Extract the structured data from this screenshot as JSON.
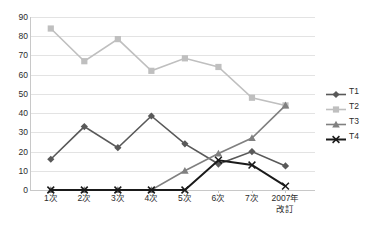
{
  "chart_data": {
    "type": "line",
    "title": "",
    "xlabel": "",
    "ylabel": "",
    "ylim": [
      0,
      90
    ],
    "ytick_step": 10,
    "grid": true,
    "legend_position": "right",
    "categories": [
      "1次",
      "2次",
      "3次",
      "4次",
      "5次",
      "6次",
      "7次",
      "2007年\n改訂"
    ],
    "categories_display": [
      "1次",
      "2次",
      "3次",
      "4次",
      "5次",
      "6次",
      "7次",
      "2007年"
    ],
    "category_last_line2": "改訂",
    "ytick_labels": [
      "90",
      "80",
      "70",
      "60",
      "50",
      "40",
      "30",
      "20",
      "10",
      "0"
    ],
    "series": [
      {
        "name": "T1",
        "color": "#595959",
        "marker": "diamond",
        "values": [
          16,
          33,
          22,
          38.5,
          24,
          13.5,
          20,
          12.5
        ]
      },
      {
        "name": "T2",
        "color": "#bfbfbf",
        "marker": "square",
        "values": [
          84,
          67,
          78.5,
          62,
          68.5,
          64,
          48,
          44
        ]
      },
      {
        "name": "T3",
        "color": "#808080",
        "marker": "triangle",
        "values": [
          0,
          0,
          0,
          0,
          10,
          19,
          27,
          44
        ]
      },
      {
        "name": "T4",
        "color": "#1a1a1a",
        "marker": "x",
        "values": [
          0,
          0,
          0,
          0,
          0,
          15.5,
          13,
          2
        ]
      }
    ]
  },
  "legend": {
    "items": [
      {
        "label": "T1"
      },
      {
        "label": "T2"
      },
      {
        "label": "T3"
      },
      {
        "label": "T4"
      }
    ]
  }
}
